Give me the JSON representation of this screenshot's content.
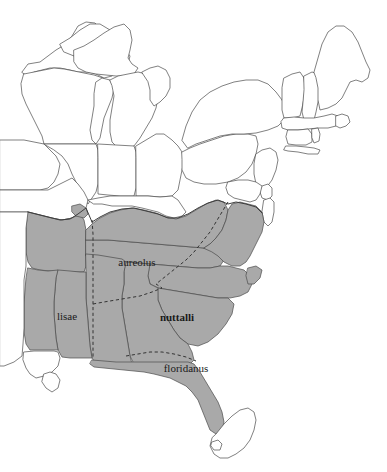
{
  "figure": {
    "kind": "distribution-map",
    "region": "Eastern United States",
    "background_color": "#ffffff",
    "shaded_range_color": "#a9a9a9",
    "unshaded_state_color": "#ffffff",
    "outline_color": "#4a4a4a",
    "range_border_color": "#3d3d3d",
    "divider_color": "#333333",
    "label_color": "#1a1a1a"
  },
  "labels": {
    "aureolus": "aureolus",
    "lisae": "lisae",
    "nuttalli": "nuttalli",
    "floridanus": "floridanus"
  },
  "subspecies": [
    {
      "name": "aureolus",
      "style": "regular",
      "x": 137,
      "y": 266
    },
    {
      "name": "lisae",
      "style": "regular",
      "x": 67,
      "y": 317
    },
    {
      "name": "nuttalli",
      "style": "bold",
      "x": 177,
      "y": 318
    },
    {
      "name": "floridanus",
      "style": "regular",
      "x": 186,
      "y": 370
    }
  ],
  "legend": {
    "shaded_meaning": "species range (shaded gray)",
    "unshaded_meaning": "outside species range (white)",
    "dashed_meaning": "subspecies boundary",
    "solid_meaning": "state boundary"
  }
}
